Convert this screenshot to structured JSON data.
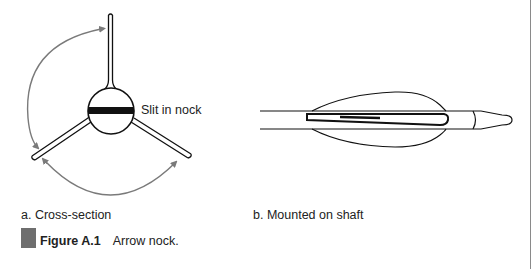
{
  "figure": {
    "id_label": "Figure A.1",
    "caption": "Arrow nock.",
    "marker_color": "#6e6e6e"
  },
  "panels": [
    {
      "label": "a.  Cross-section",
      "annotation": "Slit in nock",
      "arrow_color": "#7a7a7a"
    },
    {
      "label": "b.  Mounted on shaft"
    }
  ],
  "colors": {
    "line": "#111111",
    "arrow": "#7a7a7a",
    "border": "#8a8a8a"
  }
}
